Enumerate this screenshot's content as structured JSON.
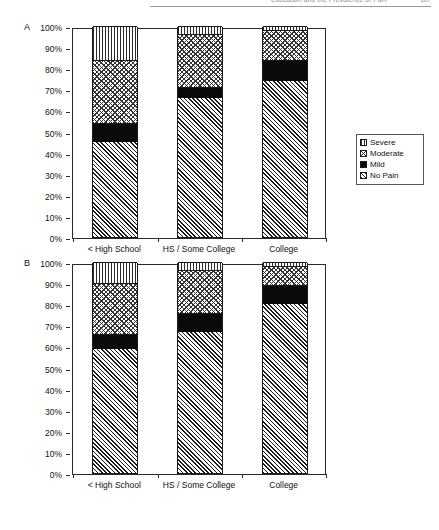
{
  "running_head": {
    "title": "Education and the Prevalence of Pain",
    "page_number": "107"
  },
  "panels": [
    {
      "letter": "A",
      "legend_title": "",
      "y_ticks": [
        "100%",
        "90%",
        "80%",
        "70%",
        "60%",
        "50%",
        "40%",
        "30%",
        "20%",
        "10%",
        "0%"
      ],
      "categories": [
        "< High School",
        "HS / Some College",
        "College"
      ],
      "legend": [
        "Severe",
        "Moderate",
        "Mild",
        "No Pain"
      ]
    },
    {
      "letter": "B",
      "legend_title": "",
      "y_ticks": [
        "100%",
        "90%",
        "80%",
        "70%",
        "60%",
        "50%",
        "40%",
        "30%",
        "20%",
        "10%",
        "0%"
      ],
      "categories": [
        "< High School",
        "HS / Some College",
        "College"
      ],
      "legend": [
        "Severe",
        "Moderate",
        "Mild",
        "No Pain"
      ]
    }
  ],
  "chart_data": [
    {
      "type": "bar",
      "panel": "A",
      "stacked": true,
      "title": "",
      "xlabel": "",
      "ylabel": "",
      "ylim": [
        0,
        100
      ],
      "yticks": [
        0,
        10,
        20,
        30,
        40,
        50,
        60,
        70,
        80,
        90,
        100
      ],
      "ytick_labels": [
        "0%",
        "10%",
        "20%",
        "30%",
        "40%",
        "50%",
        "60%",
        "70%",
        "80%",
        "90%",
        "100%"
      ],
      "grid": false,
      "legend_position": "right",
      "categories": [
        "< High School",
        "HS / Some College",
        "College"
      ],
      "series": [
        {
          "name": "No Pain",
          "values": [
            45,
            66,
            74
          ]
        },
        {
          "name": "Mild",
          "values": [
            9,
            5,
            10
          ]
        },
        {
          "name": "Moderate",
          "values": [
            30,
            25,
            14
          ]
        },
        {
          "name": "Severe",
          "values": [
            16,
            4,
            2
          ]
        }
      ]
    },
    {
      "type": "bar",
      "panel": "B",
      "stacked": true,
      "title": "",
      "xlabel": "",
      "ylabel": "",
      "ylim": [
        0,
        100
      ],
      "yticks": [
        0,
        10,
        20,
        30,
        40,
        50,
        60,
        70,
        80,
        90,
        100
      ],
      "ytick_labels": [
        "0%",
        "10%",
        "20%",
        "30%",
        "40%",
        "50%",
        "60%",
        "70%",
        "80%",
        "90%",
        "100%"
      ],
      "grid": false,
      "legend_position": "right",
      "categories": [
        "< High School",
        "HS / Some College",
        "College"
      ],
      "series": [
        {
          "name": "No Pain",
          "values": [
            59,
            67,
            80
          ]
        },
        {
          "name": "Mild",
          "values": [
            7,
            9,
            9
          ]
        },
        {
          "name": "Moderate",
          "values": [
            24,
            20,
            9
          ]
        },
        {
          "name": "Severe",
          "values": [
            10,
            4,
            2
          ]
        }
      ]
    }
  ],
  "style": {
    "axis_color": "#2b2b2b",
    "mild_color": "#0a0a0a",
    "background": "#ffffff"
  }
}
